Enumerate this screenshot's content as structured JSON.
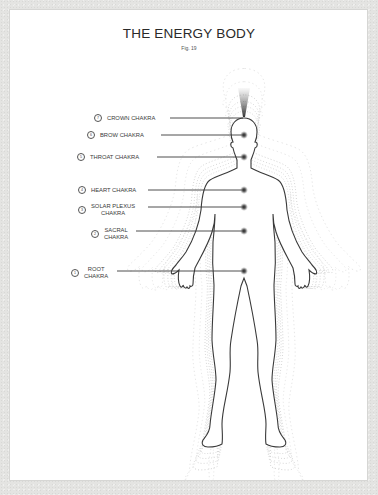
{
  "header": {
    "title": "THE ENERGY BODY",
    "figure_ref": "Fig. 19"
  },
  "chakras": [
    {
      "number": "7",
      "name": "CROWN CHAKRA",
      "line1": "CROWN CHAKRA",
      "line2": ""
    },
    {
      "number": "6",
      "name": "BROW CHAKRA",
      "line1": "BROW CHAKRA",
      "line2": ""
    },
    {
      "number": "5",
      "name": "THROAT CHAKRA",
      "line1": "THROAT CHAKRA",
      "line2": ""
    },
    {
      "number": "4",
      "name": "HEART CHAKRA",
      "line1": "HEART CHAKRA",
      "line2": ""
    },
    {
      "number": "3",
      "name": "SOLAR PLEXUS CHAKRA",
      "line1": "SOLAR PLEXUS",
      "line2": "CHAKRA"
    },
    {
      "number": "2",
      "name": "SACRAL CHAKRA",
      "line1": "SACRAL",
      "line2": "CHAKRA"
    },
    {
      "number": "1",
      "name": "ROOT CHAKRA",
      "line1": "ROOT",
      "line2": "CHAKRA"
    }
  ],
  "colors": {
    "outline": "#3a3a3a",
    "aura": "#bdbdbd",
    "background": "#e4e4e2",
    "card": "#ffffff"
  }
}
